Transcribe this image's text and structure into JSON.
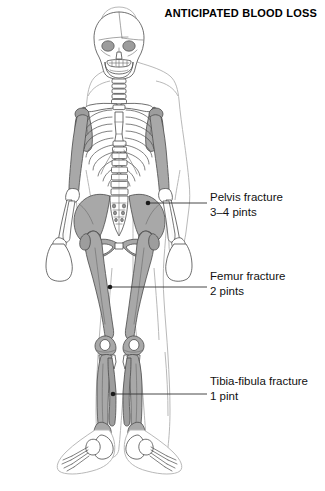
{
  "header": {
    "title": "ANTICIPATED BLOOD LOSS"
  },
  "figure": {
    "alt_name": "anterior-skeleton-diagram",
    "colors": {
      "bone_fill": "#ffffff",
      "bone_shaded": "#a8a8a8",
      "bone_outline": "#4a4a4a",
      "body_outline": "#b9b9b9",
      "leader_line": "#333333",
      "text": "#111111"
    }
  },
  "callouts": [
    {
      "id": "pelvis",
      "label": "Pelvis fracture",
      "amount": "3–4 pints",
      "target": "pelvis"
    },
    {
      "id": "femur",
      "label": "Femur fracture",
      "amount": "2 pints",
      "target": "femur"
    },
    {
      "id": "tibia",
      "label": "Tibia-fibula fracture",
      "amount": "1 pint",
      "target": "tibia-fibula"
    }
  ]
}
